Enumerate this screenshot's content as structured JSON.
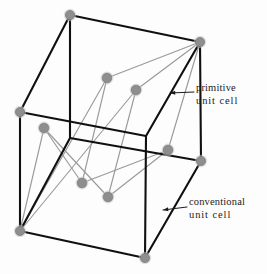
{
  "figure": {
    "kind": "crystal-lattice-diagram",
    "width": 267,
    "height": 274,
    "background_color": "#fdfdfd"
  },
  "annotations": [
    {
      "name": "primitive-unit-cell",
      "line1": "primitive",
      "line2": "unit  cell",
      "leader": {
        "x1": 194,
        "y1": 92,
        "x2": 170,
        "y2": 93,
        "arrow": "left"
      }
    },
    {
      "name": "conventional-unit-cell",
      "line1": "conventional",
      "line2": "unit  cell",
      "leader": {
        "x1": 187,
        "y1": 207,
        "x2": 163,
        "y2": 210,
        "arrow": "left"
      }
    }
  ],
  "colors": {
    "conventional_cell_stroke": "#101010",
    "primitive_cell_stroke": "#9a9a9a",
    "lattice_point_fill": "#8e8e8e",
    "lattice_point_stroke": "#6f6f6f",
    "label_text": "#1b1b1b",
    "leader_line": "#1b1b1b",
    "background": "#fdfdfd"
  },
  "geometry": {
    "conventional_cell": {
      "label": "conventional unit cell",
      "stroke_width": 2.1,
      "vertices": {
        "back_top_left": [
          70,
          15
        ],
        "back_top_right": [
          200,
          42
        ],
        "front_top_left": [
          20,
          112
        ],
        "front_top_right": [
          146,
          136
        ],
        "back_bottom_left": [
          70,
          138
        ],
        "back_bottom_right": [
          201,
          161
        ],
        "front_bottom_left": [
          20,
          231
        ],
        "front_bottom_right": [
          145,
          258
        ]
      },
      "edges": [
        [
          "back_top_left",
          "back_top_right"
        ],
        [
          "back_top_left",
          "front_top_left"
        ],
        [
          "back_top_right",
          "front_top_right"
        ],
        [
          "front_top_left",
          "front_top_right"
        ],
        [
          "back_top_left",
          "back_bottom_left"
        ],
        [
          "back_top_right",
          "back_bottom_right"
        ],
        [
          "front_top_left",
          "front_bottom_left"
        ],
        [
          "front_top_right",
          "front_bottom_right"
        ],
        [
          "back_bottom_left",
          "back_bottom_right"
        ],
        [
          "back_bottom_left",
          "front_bottom_left"
        ],
        [
          "back_bottom_right",
          "front_bottom_right"
        ],
        [
          "front_bottom_left",
          "front_bottom_right"
        ]
      ]
    },
    "primitive_cell": {
      "label": "primitive unit cell",
      "stroke_width": 1.15,
      "vertices": {
        "origin": [
          20,
          231
        ],
        "a_corner": [
          107,
          78
        ],
        "b_corner": [
          136,
          90
        ],
        "c_corner": [
          44,
          128
        ],
        "ab_corner": [
          200,
          42
        ],
        "ac_corner": [
          82,
          183
        ],
        "bc_corner": [
          108,
          197
        ],
        "abc_corner": [
          168,
          150
        ]
      },
      "edges": [
        [
          "origin",
          "a_corner"
        ],
        [
          "origin",
          "b_corner"
        ],
        [
          "origin",
          "c_corner"
        ],
        [
          "a_corner",
          "ab_corner"
        ],
        [
          "b_corner",
          "ab_corner"
        ],
        [
          "a_corner",
          "ac_corner"
        ],
        [
          "c_corner",
          "ac_corner"
        ],
        [
          "b_corner",
          "bc_corner"
        ],
        [
          "c_corner",
          "bc_corner"
        ],
        [
          "ab_corner",
          "abc_corner"
        ],
        [
          "ac_corner",
          "abc_corner"
        ],
        [
          "bc_corner",
          "abc_corner"
        ]
      ]
    },
    "lattice_points": [
      {
        "name": "point-back-top-left",
        "x": 70,
        "y": 15,
        "r": 4.6
      },
      {
        "name": "point-back-top-right",
        "x": 200,
        "y": 42,
        "r": 4.6
      },
      {
        "name": "point-front-top-left",
        "x": 20,
        "y": 112,
        "r": 4.6
      },
      {
        "name": "point-back-bottom-right",
        "x": 201,
        "y": 161,
        "r": 4.6
      },
      {
        "name": "point-front-bottom-left",
        "x": 20,
        "y": 231,
        "r": 4.6
      },
      {
        "name": "point-front-bottom-right",
        "x": 145,
        "y": 258,
        "r": 4.6
      },
      {
        "name": "point-interior-a",
        "x": 107,
        "y": 78,
        "r": 4.8
      },
      {
        "name": "point-interior-b",
        "x": 136,
        "y": 90,
        "r": 4.8
      },
      {
        "name": "point-interior-c",
        "x": 44,
        "y": 128,
        "r": 4.8
      },
      {
        "name": "point-interior-ac",
        "x": 82,
        "y": 183,
        "r": 4.8
      },
      {
        "name": "point-interior-bc",
        "x": 108,
        "y": 197,
        "r": 4.8
      },
      {
        "name": "point-interior-abc",
        "x": 168,
        "y": 150,
        "r": 4.8
      }
    ]
  }
}
